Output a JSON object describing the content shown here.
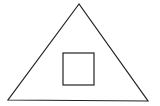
{
  "diagram": {
    "background": "#ffffff",
    "stroke_color": "#222222",
    "shapes": {
      "triangle": {
        "points": [
          [
            79,
            4
          ],
          [
            8,
            100
          ],
          [
            148,
            101
          ]
        ]
      },
      "square": {
        "x": 63,
        "y": 53,
        "width": 31,
        "height": 32
      }
    }
  }
}
